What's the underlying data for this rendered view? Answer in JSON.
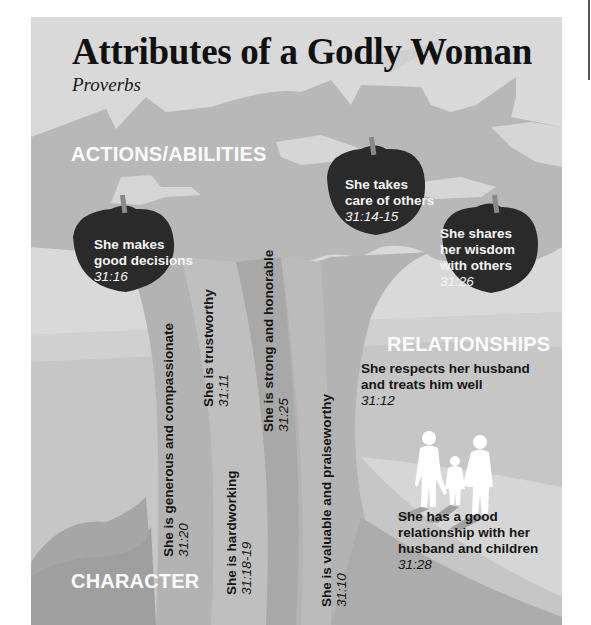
{
  "title": "Attributes of a Godly Woman",
  "subtitle": "Proverbs",
  "sections": {
    "actions": "ACTIONS/ABILITIES",
    "relationships": "RELATIONSHIPS",
    "character": "CHARACTER"
  },
  "apples": [
    {
      "line1": "She makes",
      "line2": "good decisions",
      "line3": "",
      "ref": "31:16"
    },
    {
      "line1": "She takes",
      "line2": "care of others",
      "line3": "",
      "ref": "31:14-15"
    },
    {
      "line1": "She shares",
      "line2": "her wisdom",
      "line3": "with others",
      "ref": "31:26"
    }
  ],
  "relationships": [
    {
      "line1": "She respects her husband",
      "line2": "and treats him well",
      "line3": "",
      "ref": "31:12"
    },
    {
      "line1": "She has a good",
      "line2": "relationship with her",
      "line3": "husband and children",
      "ref": "31:28"
    }
  ],
  "character": [
    {
      "text": "She is generous and compassionate",
      "ref": "31:20"
    },
    {
      "text": "She is trustworthy",
      "ref": "31:11"
    },
    {
      "text": "She is hardworking",
      "ref": "31:18-19"
    },
    {
      "text": "She is strong and honorable",
      "ref": "31:25"
    },
    {
      "text": "She is valuable and praiseworthy",
      "ref": "31:10"
    }
  ],
  "colors": {
    "background": "#d9d9d9",
    "canopy": "#b8b8b8",
    "leaf_highlight": "#dcdcdc",
    "trunk_dark": "#a9a9a9",
    "trunk_light": "#bdbdbd",
    "ground": "#c4c4c4",
    "apple": "#2b2b2b",
    "figure": "#ffffff"
  }
}
